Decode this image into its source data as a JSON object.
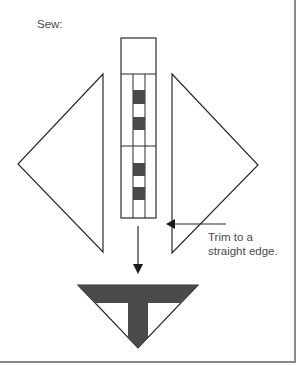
{
  "labels": {
    "step": "Sew:",
    "trim_line1": "Trim to a",
    "trim_line2": "straight edge."
  },
  "colors": {
    "line": "#2b2b2b",
    "fill_dark": "#4a4a4a",
    "text": "#4a4a4a",
    "frame": "#8a8a8a"
  },
  "diagram": {
    "strip": {
      "x": 121,
      "y": 38,
      "width": 35,
      "height": 180,
      "top_square_bottom": 74,
      "inner_lines_x": [
        133,
        145
      ],
      "divider_y": 146
    },
    "blocks": [
      {
        "y": 90,
        "h": 14
      },
      {
        "y": 117,
        "h": 13
      },
      {
        "y": 163,
        "h": 13
      },
      {
        "y": 187,
        "h": 13
      }
    ],
    "left_triangle": {
      "points": "103,74 18,164 103,252"
    },
    "right_triangle": {
      "points": "172,74 258,165 172,253"
    },
    "trim_arrow": {
      "x1": 226,
      "y1": 224,
      "x2": 167,
      "y2": 224
    },
    "down_arrow": {
      "x": 138,
      "y1": 226,
      "y2": 272
    },
    "result_shape": {
      "triangle": "78,285 198,285 138,348",
      "band_bottom": 303,
      "stem_left": 128,
      "stem_right": 148
    }
  }
}
